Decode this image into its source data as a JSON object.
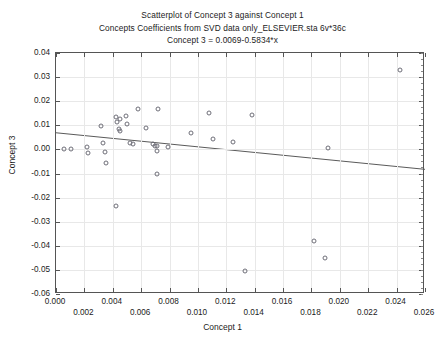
{
  "chart_data": {
    "type": "scatter",
    "title": "Scatterplot of Concept 3 against Concept 1",
    "subtitle": "Concepts Coefficients from SVD data only_ELSEVIER.sta 6v*36c",
    "equation": "Concept 3 = 0.0069-0.5834*x",
    "xlabel": "Concept 1",
    "ylabel": "Concept 3",
    "xlim": [
      0.0,
      0.026
    ],
    "ylim": [
      -0.06,
      0.04
    ],
    "grid": true,
    "legend": "none",
    "x_ticks": [
      0.0,
      0.002,
      0.004,
      0.006,
      0.008,
      0.01,
      0.012,
      0.014,
      0.016,
      0.018,
      0.02,
      0.022,
      0.024,
      0.026
    ],
    "x_tick_labels": [
      "0.000",
      "0.002",
      "0.004",
      "0.006",
      "0.008",
      "0.010",
      "0.012",
      "0.014",
      "0.016",
      "0.018",
      "0.020",
      "0.022",
      "0.024",
      "0.026"
    ],
    "y_ticks": [
      0.04,
      0.03,
      0.02,
      0.01,
      0.0,
      -0.01,
      -0.02,
      -0.03,
      -0.04,
      -0.05,
      -0.06
    ],
    "y_tick_labels": [
      "0.04",
      "0.03",
      "0.02",
      "0.01",
      "0.00",
      "-0.01",
      "-0.02",
      "-0.03",
      "-0.04",
      "-0.05",
      "-0.06"
    ],
    "fit_line": {
      "intercept": 0.0069,
      "slope": -0.5834,
      "x_start": 0.0,
      "x_end": 0.026,
      "y_start": 0.0069,
      "y_end": -0.00827
    },
    "points": [
      {
        "x": 0.00055,
        "y": 0.00035
      },
      {
        "x": 0.00105,
        "y": 0.00025
      },
      {
        "x": 0.00215,
        "y": 0.00085
      },
      {
        "x": 0.00225,
        "y": -0.00155
      },
      {
        "x": 0.0032,
        "y": 0.0099
      },
      {
        "x": 0.0033,
        "y": 0.00255
      },
      {
        "x": 0.00345,
        "y": -0.00095
      },
      {
        "x": 0.00355,
        "y": -0.00565
      },
      {
        "x": 0.0042,
        "y": 0.0134
      },
      {
        "x": 0.0043,
        "y": 0.01145
      },
      {
        "x": 0.00445,
        "y": 0.0084
      },
      {
        "x": 0.0045,
        "y": 0.0076
      },
      {
        "x": 0.0045,
        "y": 0.01255
      },
      {
        "x": 0.00425,
        "y": -0.0235
      },
      {
        "x": 0.0049,
        "y": 0.014
      },
      {
        "x": 0.005,
        "y": 0.0107
      },
      {
        "x": 0.0052,
        "y": 0.0025
      },
      {
        "x": 0.00545,
        "y": 0.0024
      },
      {
        "x": 0.0058,
        "y": 0.01665
      },
      {
        "x": 0.00635,
        "y": 0.0088
      },
      {
        "x": 0.0068,
        "y": 0.00225
      },
      {
        "x": 0.007,
        "y": 0.00135
      },
      {
        "x": 0.0071,
        "y": 0.0013
      },
      {
        "x": 0.00715,
        "y": -0.0005
      },
      {
        "x": 0.0072,
        "y": 0.01665
      },
      {
        "x": 0.00715,
        "y": -0.01
      },
      {
        "x": 0.0079,
        "y": 0.00105
      },
      {
        "x": 0.0095,
        "y": 0.0068
      },
      {
        "x": 0.0108,
        "y": 0.0153
      },
      {
        "x": 0.01105,
        "y": 0.0044
      },
      {
        "x": 0.01245,
        "y": 0.0029
      },
      {
        "x": 0.0138,
        "y": 0.0143
      },
      {
        "x": 0.0133,
        "y": -0.0505
      },
      {
        "x": 0.0182,
        "y": -0.038
      },
      {
        "x": 0.01895,
        "y": -0.04495
      },
      {
        "x": 0.0192,
        "y": 0.00045
      },
      {
        "x": 0.02425,
        "y": 0.03315
      }
    ]
  },
  "colors": {
    "point_stroke": "#6e6e78",
    "axis": "#555555",
    "grid": "#e8e8e8",
    "text": "#1b1b1b",
    "fit_line": "#5a5a5a",
    "background": "#ffffff"
  }
}
